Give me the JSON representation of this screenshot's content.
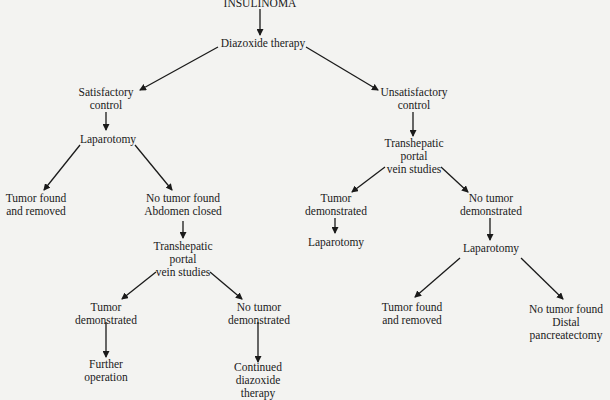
{
  "diagram": {
    "type": "flowchart",
    "nodes": {
      "root": {
        "lines": [
          "INSULINOMA"
        ]
      },
      "diazoxide": {
        "lines": [
          "Diazoxide therapy"
        ]
      },
      "satisfactory": {
        "lines": [
          "Satisfactory",
          "control"
        ]
      },
      "unsatisfactory": {
        "lines": [
          "Unsatisfactory",
          "control"
        ]
      },
      "lap_left": {
        "lines": [
          "Laparotomy"
        ]
      },
      "tumor_found_left": {
        "lines": [
          "Tumor found",
          "and removed"
        ]
      },
      "no_tumor_left": {
        "lines": [
          "No tumor found",
          "Abdomen closed"
        ]
      },
      "thps_left": {
        "lines": [
          "Transhepatic",
          "portal",
          "vein studies"
        ]
      },
      "tumor_demo_left": {
        "lines": [
          "Tumor",
          "demonstrated"
        ]
      },
      "no_tumor_demo_left": {
        "lines": [
          "No tumor",
          "demonstrated"
        ]
      },
      "further_op": {
        "lines": [
          "Further",
          "operation"
        ]
      },
      "continued_diaz": {
        "lines": [
          "Continued",
          "diazoxide",
          "therapy"
        ]
      },
      "thps_right": {
        "lines": [
          "Transhepatic",
          "portal",
          "vein studies"
        ]
      },
      "tumor_demo_right": {
        "lines": [
          "Tumor",
          "demonstrated"
        ]
      },
      "no_tumor_demo_right": {
        "lines": [
          "No tumor",
          "demonstrated"
        ]
      },
      "lap_right_a": {
        "lines": [
          "Laparotomy"
        ]
      },
      "lap_right_b": {
        "lines": [
          "Laparotomy"
        ]
      },
      "tumor_found_right": {
        "lines": [
          "Tumor found",
          "and removed"
        ]
      },
      "no_tumor_right": {
        "lines": [
          "No tumor found",
          "Distal",
          "pancreatectomy"
        ]
      }
    },
    "edges": [
      [
        "root",
        "diazoxide"
      ],
      [
        "diazoxide",
        "satisfactory"
      ],
      [
        "diazoxide",
        "unsatisfactory"
      ],
      [
        "satisfactory",
        "lap_left"
      ],
      [
        "lap_left",
        "tumor_found_left"
      ],
      [
        "lap_left",
        "no_tumor_left"
      ],
      [
        "no_tumor_left",
        "thps_left"
      ],
      [
        "thps_left",
        "tumor_demo_left"
      ],
      [
        "thps_left",
        "no_tumor_demo_left"
      ],
      [
        "tumor_demo_left",
        "further_op"
      ],
      [
        "no_tumor_demo_left",
        "continued_diaz"
      ],
      [
        "unsatisfactory",
        "thps_right"
      ],
      [
        "thps_right",
        "tumor_demo_right"
      ],
      [
        "thps_right",
        "no_tumor_demo_right"
      ],
      [
        "tumor_demo_right",
        "lap_right_a"
      ],
      [
        "no_tumor_demo_right",
        "lap_right_b"
      ],
      [
        "lap_right_b",
        "tumor_found_right"
      ],
      [
        "lap_right_b",
        "no_tumor_right"
      ]
    ]
  }
}
